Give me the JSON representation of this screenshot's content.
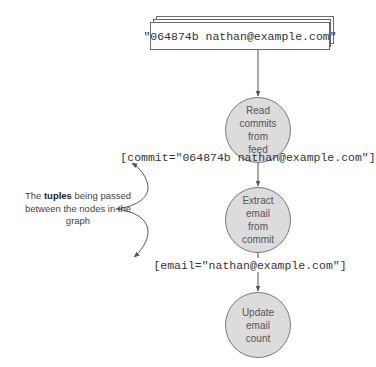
{
  "source": {
    "text": "\"064874b nathan@example.com\"",
    "icon": "stacked-documents-icon"
  },
  "nodes": [
    {
      "label": "Read\ncommits\nfrom\nfeed"
    },
    {
      "label": "Extract\nemail\nfrom\ncommit"
    },
    {
      "label": "Update\nemail\ncount"
    }
  ],
  "tuples": [
    {
      "text": "[commit=\"064874b nathan@example.com\"]"
    },
    {
      "text": "[email=\"nathan@example.com\"]"
    }
  ],
  "annotation": {
    "prefix": "The ",
    "emphasis": "tuples",
    "suffix": " being passed between the nodes in the graph"
  },
  "colors": {
    "node_fill": "#dcdcdc",
    "node_stroke": "#7a7a7a",
    "line": "#555555",
    "text": "#333333"
  }
}
